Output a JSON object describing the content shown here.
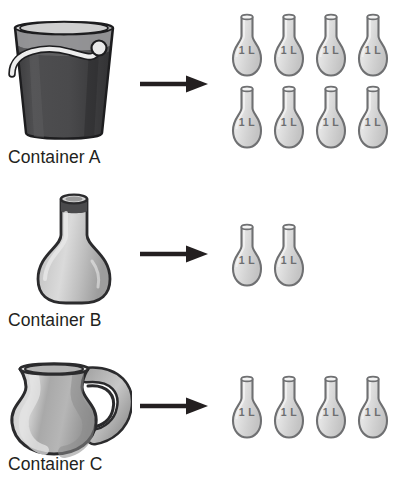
{
  "page": {
    "background_color": "#ffffff",
    "text_color": "#231f20"
  },
  "palette": {
    "bucket_body": "#4b4b4d",
    "bucket_body_dark": "#39393b",
    "bucket_rim_light": "#e6e6e6",
    "bucket_rim_shadow": "#9a9a9c",
    "bucket_handle": "#e8e8e8",
    "bottle_body": "#b9b9b9",
    "bottle_highlight": "#d6d6d6",
    "bottle_neck_band": "#4a4a4c",
    "jug_body": "#bdbdbd",
    "jug_shadow": "#9a9a9a",
    "jug_highlight": "#d8d8d8",
    "flask_fill": "#dcdcdc",
    "flask_highlight": "#ededed",
    "flask_outline": "#6f7072",
    "flask_text": "#6d6e70",
    "arrow_color": "#231f20",
    "outline": "#231f20"
  },
  "rows": [
    {
      "id": "a",
      "caption": "Container A",
      "source_icon": "bucket-icon",
      "source_name": "bucket",
      "arrow_icon": "arrow-right-icon",
      "flask_label": "1 L",
      "flask_count": 8,
      "flask_columns": 4,
      "flask_rows": 2,
      "equals_liters": 8
    },
    {
      "id": "b",
      "caption": "Container B",
      "source_icon": "bottle-icon",
      "source_name": "bottle",
      "arrow_icon": "arrow-right-icon",
      "flask_label": "1 L",
      "flask_count": 2,
      "flask_columns": 2,
      "flask_rows": 1,
      "equals_liters": 2
    },
    {
      "id": "c",
      "caption": "Container C",
      "source_icon": "jug-icon",
      "source_name": "jug",
      "arrow_icon": "arrow-right-icon",
      "flask_label": "1 L",
      "flask_count": 4,
      "flask_columns": 4,
      "flask_rows": 1,
      "equals_liters": 4
    }
  ]
}
